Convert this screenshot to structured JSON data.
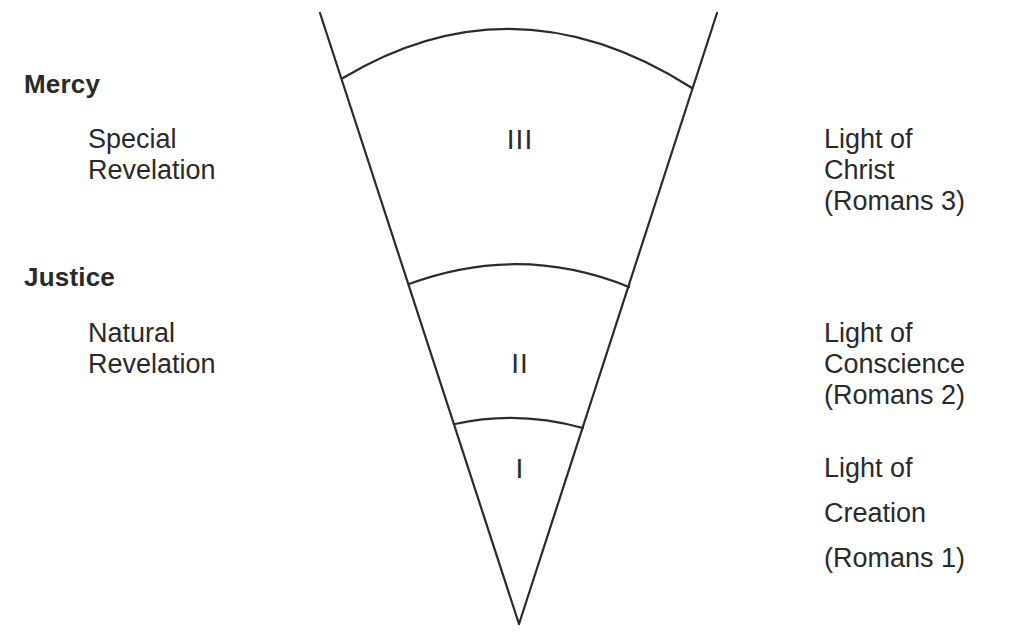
{
  "diagram": {
    "type": "cone-of-revelation",
    "left_headings": {
      "mercy": {
        "title": "Mercy",
        "lines": [
          "Special",
          "Revelation"
        ]
      },
      "justice": {
        "title": "Justice",
        "lines": [
          "Natural",
          "Revelation"
        ]
      }
    },
    "sections": [
      {
        "numeral": "III",
        "right_lines": [
          "Light of",
          "Christ",
          "(Romans 3)"
        ]
      },
      {
        "numeral": "II",
        "right_lines": [
          "Light of",
          "Conscience",
          "(Romans 2)"
        ]
      },
      {
        "numeral": "I",
        "right_lines": [
          "Light of",
          "Creation",
          "(Romans 1)"
        ]
      }
    ],
    "colors": {
      "ink": "#2b2b2b",
      "background": "#ffffff"
    }
  }
}
